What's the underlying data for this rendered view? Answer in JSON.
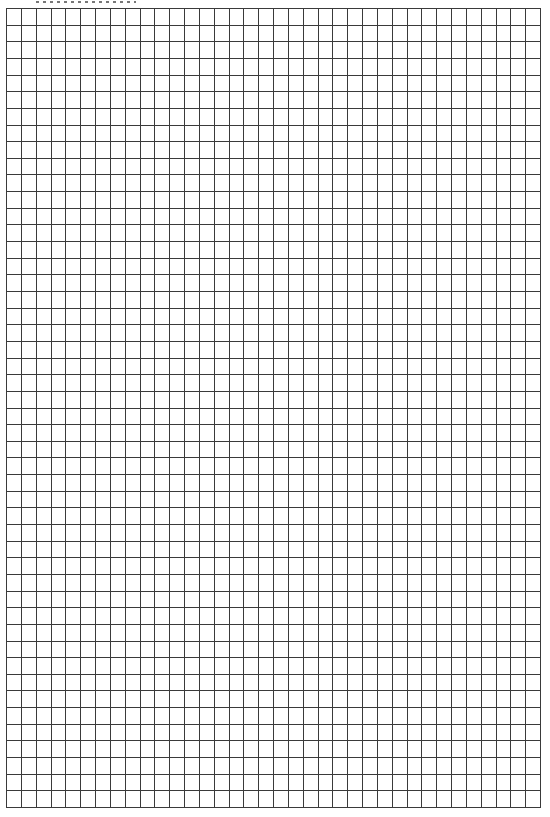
{
  "document": {
    "type": "graph-paper",
    "header_text_visible": false,
    "header_text": ""
  },
  "grid": {
    "columns": 36,
    "rows": 48,
    "left": 6,
    "top": 8,
    "width": 535,
    "height": 800,
    "line_color": "#3a3a3a",
    "line_width": 1,
    "background": "#ffffff"
  }
}
